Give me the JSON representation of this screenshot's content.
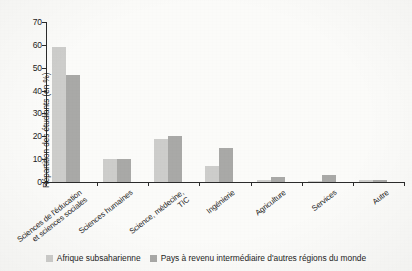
{
  "chart_data": {
    "type": "bar",
    "title": "",
    "xlabel": "",
    "ylabel": "Répartition des étudiants (en %)",
    "ylim": [
      0,
      70
    ],
    "yticks": [
      "0",
      "10",
      "20",
      "30",
      "40",
      "50",
      "60",
      "70"
    ],
    "grid": false,
    "legend_position": "bottom",
    "categories": [
      "Sciences de l'éducation et sciences sociales",
      "Sciences humaines",
      "Science, médecine, TIC",
      "Ingénierie",
      "Agriculture",
      "Services",
      "Autre"
    ],
    "category_lines": [
      [
        "Sciences de l'éducation",
        "et sciences sociales"
      ],
      [
        "Sciences humaines",
        ""
      ],
      [
        "Science, médecine,",
        "TIC"
      ],
      [
        "Ingénierie",
        ""
      ],
      [
        "Agriculture",
        ""
      ],
      [
        "Services",
        ""
      ],
      [
        "Autre",
        ""
      ]
    ],
    "series": [
      {
        "name": "Afrique subsaharienne",
        "color": "#cdcdcb",
        "values": [
          59,
          10,
          19,
          7,
          1,
          0.5,
          1
        ]
      },
      {
        "name": "Pays à revenu intermédiaire d'autres régions du monde",
        "color": "#a9a9a7",
        "values": [
          47,
          10,
          20,
          15,
          2,
          3,
          1
        ]
      }
    ]
  }
}
